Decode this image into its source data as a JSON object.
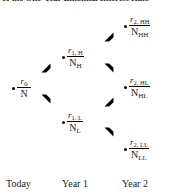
{
  "figure": {
    "type": "binomial-tree-diagram",
    "top_caption_clipped": "of the One-Year Binomial Interest Rate",
    "background_color": "#ffffff",
    "ink_color": "#000000"
  },
  "nodes": [
    {
      "id": "root",
      "period": "Today",
      "numerator_symbol": "r",
      "numerator_subscript": "0",
      "denominator_symbol": "N",
      "denominator_subscript": "",
      "label": "r0 / N"
    },
    {
      "id": "high-1",
      "period": "Year 1",
      "numerator_symbol": "r",
      "numerator_subscript": "1, H",
      "denominator_symbol": "N",
      "denominator_subscript": "H",
      "label": "r1,H / NH"
    },
    {
      "id": "low-1",
      "period": "Year 1",
      "numerator_symbol": "r",
      "numerator_subscript": "1, L",
      "denominator_symbol": "N",
      "denominator_subscript": "L",
      "label": "r1,L / NL"
    },
    {
      "id": "high-high-2",
      "period": "Year 2",
      "numerator_symbol": "r",
      "numerator_subscript": "2, HH",
      "denominator_symbol": "N",
      "denominator_subscript": "HH",
      "label": "r2,HH / NHH"
    },
    {
      "id": "high-low-2",
      "period": "Year 2",
      "numerator_symbol": "r",
      "numerator_subscript": "2, HL",
      "denominator_symbol": "N",
      "denominator_subscript": "HL",
      "label": "r2,HL / NHL"
    },
    {
      "id": "low-low-2",
      "period": "Year 2",
      "numerator_symbol": "r",
      "numerator_subscript": "2, LL",
      "denominator_symbol": "N",
      "denominator_subscript": "LL",
      "label": "r2,LL / NLL"
    }
  ],
  "arrows": [
    {
      "id": "root-to-high-1",
      "from": "root",
      "to": "high-1",
      "direction": "up-right",
      "icon": "arrowhead-up-right-icon"
    },
    {
      "id": "root-to-low-1",
      "from": "root",
      "to": "low-1",
      "direction": "down-right",
      "icon": "arrowhead-down-right-icon"
    },
    {
      "id": "high-1-to-hh",
      "from": "high-1",
      "to": "high-high-2",
      "direction": "up-right",
      "icon": "arrowhead-up-right-icon"
    },
    {
      "id": "high-1-to-hl",
      "from": "high-1",
      "to": "high-low-2",
      "direction": "down-right",
      "icon": "arrowhead-down-right-icon"
    },
    {
      "id": "low-1-to-hl",
      "from": "low-1",
      "to": "high-low-2",
      "direction": "up-right",
      "icon": "arrowhead-up-right-icon"
    },
    {
      "id": "low-1-to-ll",
      "from": "low-1",
      "to": "low-low-2",
      "direction": "down-right",
      "icon": "arrowhead-down-right-icon"
    }
  ],
  "axis": {
    "labels": [
      {
        "id": "today",
        "text": "Today"
      },
      {
        "id": "year-1",
        "text": "Year 1"
      },
      {
        "id": "year-2",
        "text": "Year 2"
      }
    ]
  }
}
